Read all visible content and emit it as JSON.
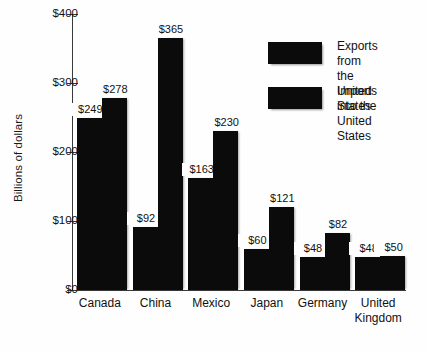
{
  "chart_data": {
    "type": "bar",
    "title": "",
    "xlabel": "",
    "ylabel": "Billions of dollars",
    "ylim": [
      0,
      400
    ],
    "y_ticks": [
      "$0",
      "$100",
      "$200",
      "$300",
      "$400"
    ],
    "y_tick_values": [
      0,
      100,
      200,
      300,
      400
    ],
    "grid": false,
    "legend_position": "upper right",
    "categories": [
      "Canada",
      "China",
      "Mexico",
      "Japan",
      "Germany",
      "United\nKingdom"
    ],
    "series": [
      {
        "name": "Exports from the\nUnited States",
        "values": [
          249,
          92,
          163,
          60,
          48,
          48
        ],
        "labels": [
          "$249",
          "$92",
          "$163",
          "$60",
          "$48",
          "$48"
        ],
        "color": "#0b0b0b"
      },
      {
        "name": "Imports into the\nUnited States",
        "values": [
          278,
          365,
          230,
          121,
          82,
          50
        ],
        "labels": [
          "$278",
          "$365",
          "$230",
          "$121",
          "$82",
          "$50"
        ],
        "color": "#0b0b0b"
      }
    ]
  },
  "legend": {
    "items": [
      {
        "label": "Exports from the\nUnited States",
        "color": "#0b0b0b"
      },
      {
        "label": "Imports into the\nUnited States",
        "color": "#0b0b0b"
      }
    ]
  },
  "axis": {
    "y_title": "Billions of dollars"
  }
}
